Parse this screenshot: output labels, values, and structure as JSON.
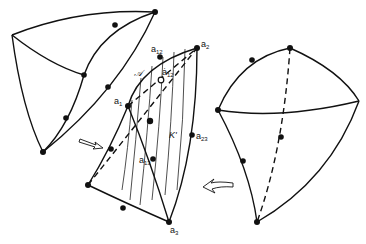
{
  "figure": {
    "left_tetrahedron": {
      "label": "initial tetrahedron"
    },
    "middle_surface": {
      "labels": {
        "a1": {
          "base": "a",
          "sub": "1"
        },
        "a2": {
          "base": "a",
          "sub": "2"
        },
        "a3": {
          "base": "a",
          "sub": "3"
        },
        "a12": {
          "base": "a",
          "sub": "12"
        },
        "a12_hat": {
          "base": "ȧ",
          "sub": "12"
        },
        "a13": {
          "base": "a",
          "sub": "13"
        },
        "a23": {
          "base": "a",
          "sub": "23"
        },
        "script_A": "𝒜",
        "K_prime": "K'"
      }
    },
    "right_tetrahedron": {
      "label": "deformed tetrahedron"
    },
    "arrows": {
      "left": "arrow-right",
      "right": "arrow-left"
    }
  }
}
